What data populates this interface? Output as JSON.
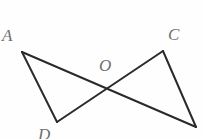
{
  "figure": {
    "background_color": "#fefefe",
    "stroke_color": "#2a2a2a",
    "label_color": "#6e6e6e",
    "stroke_width": 2,
    "width": 203,
    "height": 139,
    "points": {
      "A": {
        "label": "A",
        "x": 22,
        "y": 52,
        "label_x": 2,
        "label_y": 27
      },
      "C": {
        "label": "C",
        "x": 163,
        "y": 51,
        "label_x": 168,
        "label_y": 26
      },
      "O": {
        "label": "O",
        "x": 108,
        "y": 88,
        "label_x": 99,
        "label_y": 57
      },
      "D": {
        "label": "D",
        "x": 57,
        "y": 122,
        "label_x": 38,
        "label_y": 126
      },
      "B": {
        "label": "",
        "x": 196,
        "y": 127,
        "label_x": 0,
        "label_y": 0
      }
    },
    "segments": [
      {
        "name": "segment-A-D",
        "from": "A",
        "to": "D",
        "path": "M 22 52 L 57 122"
      },
      {
        "name": "segment-A-B",
        "from": "A",
        "to": "B",
        "path": "M 22 52 L 196 127"
      },
      {
        "name": "segment-C-D",
        "from": "C",
        "to": "D",
        "path": "M 163 51 L 57 122"
      },
      {
        "name": "segment-C-B",
        "from": "C",
        "to": "B",
        "path": "M 163 51 L 196 127"
      }
    ],
    "labels": [
      {
        "name": "vertex-label-a",
        "text": "A"
      },
      {
        "name": "vertex-label-c",
        "text": "C"
      },
      {
        "name": "vertex-label-o",
        "text": "O"
      },
      {
        "name": "vertex-label-d",
        "text": "D"
      }
    ]
  }
}
